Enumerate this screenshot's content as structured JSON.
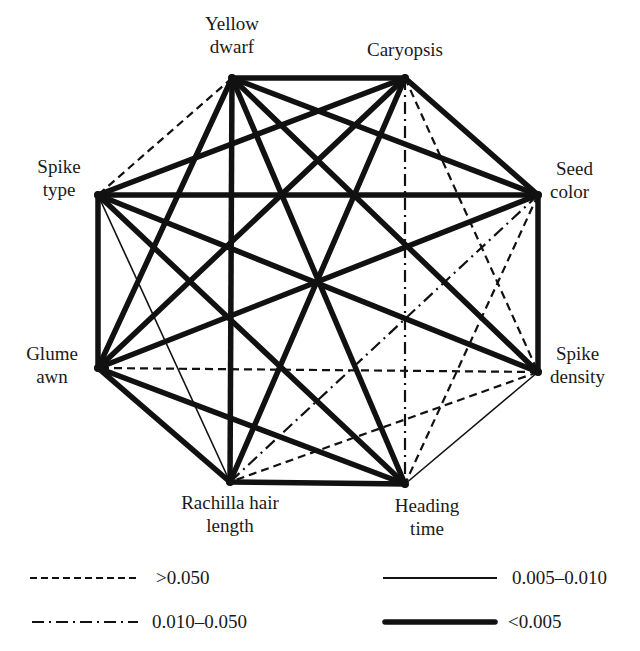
{
  "diagram": {
    "type": "complete-graph-linkage",
    "nodes": [
      {
        "id": "YD",
        "label_lines": [
          "Yellow",
          "dwarf"
        ],
        "x": 232,
        "y": 78
      },
      {
        "id": "CA",
        "label_lines": [
          "Caryopsis"
        ],
        "x": 405,
        "y": 78
      },
      {
        "id": "SC",
        "label_lines": [
          "Seed",
          "color"
        ],
        "x": 538,
        "y": 195
      },
      {
        "id": "SD",
        "label_lines": [
          "Spike",
          "density"
        ],
        "x": 538,
        "y": 372
      },
      {
        "id": "HT",
        "label_lines": [
          "Heading",
          "time"
        ],
        "x": 405,
        "y": 484
      },
      {
        "id": "RH",
        "label_lines": [
          "Rachilla hair",
          "length"
        ],
        "x": 230,
        "y": 482
      },
      {
        "id": "GA",
        "label_lines": [
          "Glume",
          "awn"
        ],
        "x": 98,
        "y": 368
      },
      {
        "id": "ST",
        "label_lines": [
          "Spike",
          "type"
        ],
        "x": 98,
        "y": 195
      }
    ],
    "edges": [
      {
        "from": "YD",
        "to": "CA",
        "style": "lt0005"
      },
      {
        "from": "YD",
        "to": "SC",
        "style": "lt0005"
      },
      {
        "from": "YD",
        "to": "SD",
        "style": "lt0005"
      },
      {
        "from": "YD",
        "to": "HT",
        "style": "lt0005"
      },
      {
        "from": "YD",
        "to": "RH",
        "style": "lt0005"
      },
      {
        "from": "YD",
        "to": "GA",
        "style": "lt0005"
      },
      {
        "from": "YD",
        "to": "ST",
        "style": "gt0050"
      },
      {
        "from": "CA",
        "to": "SC",
        "style": "lt0005"
      },
      {
        "from": "CA",
        "to": "SD",
        "style": "gt0050"
      },
      {
        "from": "CA",
        "to": "HT",
        "style": "r0010_0050"
      },
      {
        "from": "CA",
        "to": "RH",
        "style": "lt0005"
      },
      {
        "from": "CA",
        "to": "GA",
        "style": "lt0005"
      },
      {
        "from": "CA",
        "to": "ST",
        "style": "lt0005"
      },
      {
        "from": "SC",
        "to": "SD",
        "style": "lt0005"
      },
      {
        "from": "SC",
        "to": "HT",
        "style": "gt0050"
      },
      {
        "from": "SC",
        "to": "RH",
        "style": "r0010_0050"
      },
      {
        "from": "SC",
        "to": "GA",
        "style": "lt0005"
      },
      {
        "from": "SC",
        "to": "ST",
        "style": "lt0005"
      },
      {
        "from": "SD",
        "to": "HT",
        "style": "r0005_0010"
      },
      {
        "from": "SD",
        "to": "RH",
        "style": "gt0050"
      },
      {
        "from": "SD",
        "to": "GA",
        "style": "gt0050"
      },
      {
        "from": "SD",
        "to": "ST",
        "style": "lt0005"
      },
      {
        "from": "HT",
        "to": "RH",
        "style": "lt0005"
      },
      {
        "from": "HT",
        "to": "GA",
        "style": "lt0005"
      },
      {
        "from": "HT",
        "to": "ST",
        "style": "lt0005"
      },
      {
        "from": "RH",
        "to": "GA",
        "style": "lt0005"
      },
      {
        "from": "RH",
        "to": "ST",
        "style": "r0005_0010"
      },
      {
        "from": "GA",
        "to": "ST",
        "style": "lt0005"
      }
    ]
  },
  "labels": {
    "yellow_dwarf": {
      "line1": "Yellow",
      "line2": "dwarf"
    },
    "caryopsis": {
      "line1": "Caryopsis"
    },
    "seed_color": {
      "line1": "Seed",
      "line2": "color"
    },
    "spike_density": {
      "line1": "Spike",
      "line2": "density"
    },
    "heading_time": {
      "line1": "Heading",
      "line2": "time"
    },
    "rachilla": {
      "line1": "Rachilla hair",
      "line2": "length"
    },
    "glume_awn": {
      "line1": "Glume",
      "line2": "awn"
    },
    "spike_type": {
      "line1": "Spike",
      "line2": "type"
    }
  },
  "legend": {
    "items": [
      {
        "key": "gt0050",
        "label": ">0.050",
        "line": "dashed"
      },
      {
        "key": "r0005_0010",
        "label": "0.005–0.010",
        "line": "thin-solid"
      },
      {
        "key": "r0010_0050",
        "label": "0.010–0.050",
        "line": "dash-dot"
      },
      {
        "key": "lt0005",
        "label": "<0.005",
        "line": "thick-solid"
      }
    ]
  },
  "styles": {
    "line_color": "#111111",
    "gt0050": {
      "width": 2.2,
      "dash": "8,5"
    },
    "r0010_0050": {
      "width": 2.2,
      "dash": "12,5,2,5"
    },
    "r0005_0010": {
      "width": 1.6,
      "dash": ""
    },
    "lt0005": {
      "width": 5.5,
      "dash": ""
    }
  }
}
